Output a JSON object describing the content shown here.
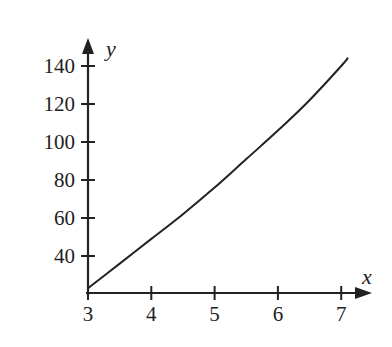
{
  "chart_data": {
    "type": "line",
    "title": "",
    "xlabel": "x",
    "ylabel": "y",
    "x_ticks": [
      3,
      4,
      5,
      6,
      7
    ],
    "y_ticks": [
      40,
      60,
      80,
      100,
      120,
      140
    ],
    "xlim": [
      3,
      7.3
    ],
    "ylim": [
      20,
      150
    ],
    "grid": false,
    "legend": null,
    "series": [
      {
        "name": "curve",
        "color": "#222222",
        "x": [
          3,
          3.5,
          4,
          4.5,
          5,
          5.5,
          6,
          6.5,
          7,
          7.1
        ],
        "y": [
          23,
          36,
          49,
          62,
          76,
          91,
          106,
          122,
          140,
          144
        ]
      }
    ]
  },
  "colors": {
    "axis": "#222222",
    "line": "#222222",
    "background": "#ffffff"
  }
}
